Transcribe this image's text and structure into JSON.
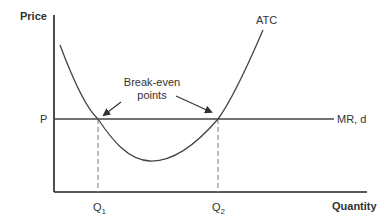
{
  "diagram": {
    "type": "economics-cost-curve",
    "axes": {
      "y_label": "Price",
      "x_label": "Quantity"
    },
    "curves": {
      "atc": {
        "label": "ATC",
        "shape": "U-shaped"
      },
      "mr": {
        "label": "MR, d",
        "shape": "horizontal"
      }
    },
    "price_level": {
      "label": "P"
    },
    "quantity_markers": [
      {
        "label": "Q",
        "subscript": "1"
      },
      {
        "label": "Q",
        "subscript": "2"
      }
    ],
    "annotation": {
      "line1": "Break-even",
      "line2": "points"
    },
    "colors": {
      "axis": "#222222",
      "curve": "#444444",
      "dashed": "#888888",
      "text": "#333333"
    }
  }
}
